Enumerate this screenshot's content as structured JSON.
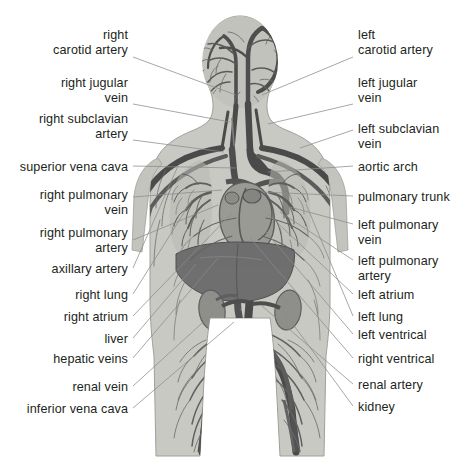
{
  "diagram": {
    "background_color": "#ffffff",
    "text_color": "#231f20",
    "leader_line_color": "#8a8a8a",
    "palette": {
      "body_silhouette": "#c9c9c4",
      "body_outline": "#a8a8a2",
      "vessel_dark": "#4a4a4a",
      "vessel_mid": "#6e6e6e",
      "vessel_light": "#8e8e8e",
      "organ_liver": "#6b6b6b",
      "organ_heart": "#8d8d8d",
      "organ_lung": "#b4b4b0"
    },
    "figure_bounds": {
      "x": 150,
      "y": 16,
      "width": 196,
      "height": 440
    }
  },
  "labels_left": [
    {
      "id": "right-carotid-artery",
      "lines": [
        "right",
        "carotid artery"
      ],
      "text_right_x": 128,
      "text_top_y": 28,
      "leader": {
        "x1": 133,
        "y1": 57,
        "x2": 236,
        "y2": 95
      }
    },
    {
      "id": "right-jugular-vein",
      "lines": [
        "right jugular",
        "vein"
      ],
      "text_right_x": 128,
      "text_top_y": 76,
      "leader": {
        "x1": 133,
        "y1": 104,
        "x2": 230,
        "y2": 122
      }
    },
    {
      "id": "right-subclavian-artery",
      "lines": [
        "right subclavian",
        "artery"
      ],
      "text_right_x": 128,
      "text_top_y": 112,
      "leader": {
        "x1": 133,
        "y1": 140,
        "x2": 224,
        "y2": 152
      }
    },
    {
      "id": "superior-vena-cava",
      "lines": [
        "superior vena cava"
      ],
      "text_right_x": 128,
      "text_top_y": 160,
      "leader": {
        "x1": 133,
        "y1": 166,
        "x2": 236,
        "y2": 168
      }
    },
    {
      "id": "right-pulmonary-vein",
      "lines": [
        "right pulmonary",
        "vein"
      ],
      "text_right_x": 128,
      "text_top_y": 188,
      "leader": {
        "x1": 133,
        "y1": 197,
        "x2": 222,
        "y2": 190
      }
    },
    {
      "id": "right-pulmonary-artery",
      "lines": [
        "right pulmonary",
        "artery"
      ],
      "text_right_x": 128,
      "text_top_y": 226,
      "leader": {
        "x1": 133,
        "y1": 240,
        "x2": 218,
        "y2": 205
      }
    },
    {
      "id": "axillary-artery",
      "lines": [
        "axillary artery"
      ],
      "text_right_x": 128,
      "text_top_y": 262,
      "leader": {
        "x1": 133,
        "y1": 268,
        "x2": 178,
        "y2": 166
      }
    },
    {
      "id": "right-lung",
      "lines": [
        "right lung"
      ],
      "text_right_x": 128,
      "text_top_y": 288,
      "leader": {
        "x1": 133,
        "y1": 294,
        "x2": 192,
        "y2": 200
      }
    },
    {
      "id": "right-atrium",
      "lines": [
        "right atrium"
      ],
      "text_right_x": 128,
      "text_top_y": 310,
      "leader": {
        "x1": 133,
        "y1": 316,
        "x2": 232,
        "y2": 213
      }
    },
    {
      "id": "liver",
      "lines": [
        "liver"
      ],
      "text_right_x": 128,
      "text_top_y": 332,
      "leader": {
        "x1": 133,
        "y1": 338,
        "x2": 196,
        "y2": 264
      }
    },
    {
      "id": "hepatic-veins",
      "lines": [
        "hepatic veins"
      ],
      "text_right_x": 128,
      "text_top_y": 352,
      "leader": {
        "x1": 133,
        "y1": 358,
        "x2": 218,
        "y2": 258
      }
    },
    {
      "id": "renal-vein",
      "lines": [
        "renal vein"
      ],
      "text_right_x": 128,
      "text_top_y": 380,
      "leader": {
        "x1": 133,
        "y1": 386,
        "x2": 222,
        "y2": 305
      }
    },
    {
      "id": "inferior-vena-cava",
      "lines": [
        "inferior vena cava"
      ],
      "text_right_x": 128,
      "text_top_y": 402,
      "leader": {
        "x1": 133,
        "y1": 408,
        "x2": 234,
        "y2": 322
      }
    }
  ],
  "labels_right": [
    {
      "id": "left-carotid-artery",
      "lines": [
        "left",
        "carotid artery"
      ],
      "text_left_x": 358,
      "text_top_y": 28,
      "leader": {
        "x1": 353,
        "y1": 57,
        "x2": 262,
        "y2": 95
      }
    },
    {
      "id": "left-jugular-vein",
      "lines": [
        "left jugular",
        "vein"
      ],
      "text_left_x": 358,
      "text_top_y": 76,
      "leader": {
        "x1": 353,
        "y1": 104,
        "x2": 268,
        "y2": 124
      }
    },
    {
      "id": "left-subclavian-vein",
      "lines": [
        "left subclavian",
        "vein"
      ],
      "text_left_x": 358,
      "text_top_y": 122,
      "leader": {
        "x1": 353,
        "y1": 130,
        "x2": 300,
        "y2": 148
      }
    },
    {
      "id": "aortic-arch",
      "lines": [
        "aortic arch"
      ],
      "text_left_x": 358,
      "text_top_y": 160,
      "leader": {
        "x1": 353,
        "y1": 166,
        "x2": 268,
        "y2": 172
      }
    },
    {
      "id": "pulmonary-trunk",
      "lines": [
        "pulmonary trunk"
      ],
      "text_left_x": 358,
      "text_top_y": 190,
      "leader": {
        "x1": 353,
        "y1": 196,
        "x2": 262,
        "y2": 192
      }
    },
    {
      "id": "left-pulmonary-vein",
      "lines": [
        "left pulmonary",
        "vein"
      ],
      "text_left_x": 358,
      "text_top_y": 218,
      "leader": {
        "x1": 353,
        "y1": 224,
        "x2": 286,
        "y2": 206
      }
    },
    {
      "id": "left-pulmonary-artery",
      "lines": [
        "left pulmonary",
        "artery"
      ],
      "text_left_x": 358,
      "text_top_y": 254,
      "leader": {
        "x1": 353,
        "y1": 260,
        "x2": 280,
        "y2": 212
      }
    },
    {
      "id": "left-atrium",
      "lines": [
        "left atrium"
      ],
      "text_left_x": 358,
      "text_top_y": 288,
      "leader": {
        "x1": 353,
        "y1": 294,
        "x2": 268,
        "y2": 214
      }
    },
    {
      "id": "left-lung",
      "lines": [
        "left lung"
      ],
      "text_left_x": 358,
      "text_top_y": 310,
      "leader": {
        "x1": 353,
        "y1": 316,
        "x2": 306,
        "y2": 204
      }
    },
    {
      "id": "left-ventrical",
      "lines": [
        "left ventrical"
      ],
      "text_left_x": 358,
      "text_top_y": 328,
      "leader": {
        "x1": 353,
        "y1": 334,
        "x2": 266,
        "y2": 232
      }
    },
    {
      "id": "right-ventrical",
      "lines": [
        "right ventrical"
      ],
      "text_left_x": 358,
      "text_top_y": 352,
      "leader": {
        "x1": 353,
        "y1": 358,
        "x2": 250,
        "y2": 238
      }
    },
    {
      "id": "renal-artery",
      "lines": [
        "renal artery"
      ],
      "text_left_x": 358,
      "text_top_y": 378,
      "leader": {
        "x1": 353,
        "y1": 384,
        "x2": 262,
        "y2": 306
      }
    },
    {
      "id": "kidney",
      "lines": [
        "kidney"
      ],
      "text_left_x": 358,
      "text_top_y": 400,
      "leader": {
        "x1": 353,
        "y1": 406,
        "x2": 284,
        "y2": 312
      }
    }
  ]
}
